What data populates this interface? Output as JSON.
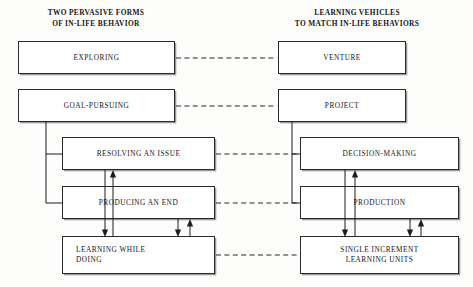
{
  "diagram": {
    "title_left": "TWO PERVASIVE FORMS\nOF IN-LIFE BEHAVIOR",
    "title_right": "LEARNING VEHICLES\nTO MATCH IN-LIFE BEHAVIORS",
    "colors": {
      "line": "#1d1d20",
      "box_border": "#2a2a2e",
      "text": "#141418",
      "background": "#fdfdfc",
      "shadow": "#9a9a9a"
    },
    "nodes": {
      "exploring": "EXPLORING",
      "goal_pursuing": "GOAL-PURSUING",
      "resolving": "RESOLVING AN ISSUE",
      "producing": "PRODUCING AN END",
      "learning_while_doing": "LEARNING WHILE\nDOING",
      "venture": "VENTURE",
      "project": "PROJECT",
      "decision_making": "DECISION-MAKING",
      "production": "PRODUCTION",
      "single_increment": "SINGLE INCREMENT\nLEARNING UNITS"
    },
    "links": {
      "dashed_pairs": [
        "EXPLORING — VENTURE",
        "GOAL-PURSUING — PROJECT",
        "RESOLVING AN ISSUE — DECISION-MAKING",
        "PRODUCING AN END — PRODUCTION",
        "LEARNING WHILE DOING — SINGLE INCREMENT LEARNING UNITS"
      ]
    }
  }
}
